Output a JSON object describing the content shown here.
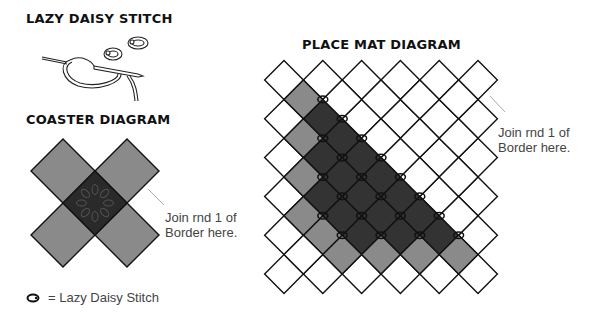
{
  "lazy_daisy": {
    "title": "LAZY DAISY STITCH"
  },
  "coaster": {
    "title": "COASTER DIAGRAM",
    "join_note_line1": "Join rnd 1 of",
    "join_note_line2": "Border  here.",
    "center": [
      95,
      203
    ],
    "half_diagonal": 32,
    "colors": {
      "arm": "#8a8a8a",
      "center": "#2a2a2a",
      "outline": "#111111"
    }
  },
  "place_mat": {
    "title": "PLACE MAT DIAGRAM",
    "join_note_line1": "Join rnd 1 of",
    "join_note_line2": "Border  here.",
    "grid": {
      "origin_a": [
        284,
        80
      ],
      "origin_b": [
        303.4,
        99.4
      ],
      "step": 38.8,
      "half_diagonal": 19.4,
      "a_cols": 6,
      "a_rows": 6,
      "b_cols": 5,
      "b_rows": 5
    },
    "colors": {
      "white": "#ffffff",
      "gray": "#8a8a8a",
      "dark": "#333333",
      "outline": "#111111"
    },
    "gray_cells": [
      [
        "b",
        0,
        0
      ],
      [
        "b",
        0,
        1
      ],
      [
        "b",
        0,
        2
      ],
      [
        "b",
        0,
        3
      ],
      [
        "a",
        1,
        4
      ],
      [
        "b",
        1,
        4
      ],
      [
        "b",
        2,
        4
      ],
      [
        "b",
        3,
        4
      ],
      [
        "b",
        4,
        4
      ]
    ]
  },
  "legend": {
    "icon": "lazy-daisy-stitch-icon",
    "label": "= Lazy Daisy Stitch"
  }
}
